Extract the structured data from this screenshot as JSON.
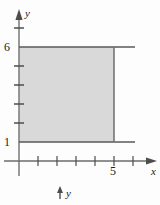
{
  "figure": {
    "kind": "cartesian-plane-shaded-rectangle",
    "width": 160,
    "height": 205,
    "background_color": "#fdfdfd"
  },
  "colors": {
    "axis": "#6b6b6b",
    "boundary": "#595959",
    "fill": "#d9d9d9",
    "text": "#1a1a1a"
  },
  "axes": {
    "x_axis": {
      "label": "x",
      "label_style": "italic",
      "arrow": "right",
      "pixel_y": 161,
      "origin_pixel_x": 19,
      "unit_pixels": 19,
      "tick_pixels_x": [
        38,
        57,
        76,
        95,
        114,
        133
      ],
      "tick_values": [
        1,
        2,
        3,
        4,
        5,
        6
      ],
      "labeled_ticks": [
        {
          "value": "5",
          "pixel_x": 114
        }
      ]
    },
    "y_axis": {
      "label": "y",
      "label_style": "italic",
      "arrow": "up",
      "pixel_x": 19,
      "origin_pixel_y": 161,
      "unit_pixels": 19,
      "tick_pixels_y": [
        28,
        47,
        66,
        85,
        104,
        123,
        142
      ],
      "tick_values": [
        7,
        6,
        5,
        4,
        3,
        2,
        1
      ],
      "labeled_ticks": [
        {
          "value": "6",
          "pixel_y": 47
        },
        {
          "value": "1",
          "pixel_y": 142
        }
      ]
    }
  },
  "shaded_region": {
    "description": "rectangle 0 <= x <= 5, 1 <= y <= 6",
    "x_from": 0,
    "x_to": 5,
    "y_from": 1,
    "y_to": 6,
    "fill_color": "#d9d9d9",
    "pixel_box": {
      "left": 19,
      "top": 47,
      "right": 114,
      "bottom": 142
    }
  },
  "boundary_lines": [
    {
      "name": "top-line-y-6",
      "orientation": "horizontal",
      "pixel_y": 47,
      "pixel_x_from": 19,
      "pixel_x_to": 135
    },
    {
      "name": "bottom-line-y-1",
      "orientation": "horizontal",
      "pixel_y": 142,
      "pixel_x_from": 19,
      "pixel_x_to": 135
    },
    {
      "name": "right-line-x-5",
      "orientation": "vertical",
      "pixel_x": 114,
      "pixel_y_from": 47,
      "pixel_y_to": 142
    }
  ],
  "stray_annotation": {
    "label": "y",
    "label_style": "italic",
    "arrow": "up",
    "pixel_x": 60,
    "pixel_y": 193
  }
}
